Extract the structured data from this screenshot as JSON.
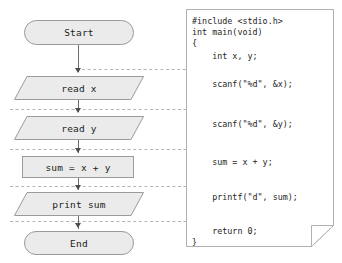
{
  "diagram": {
    "colors": {
      "shape_fill": "#ebebeb",
      "shape_border": "#9a9a9a",
      "connector": "#6d6d6d",
      "dashed_line": "#b4b4b4",
      "panel_border": "#b0b0b0",
      "panel_fill": "#ffffff",
      "text": "#1c1c1c",
      "background": "#ffffff"
    }
  },
  "flowchart": {
    "nodes": [
      {
        "id": "start",
        "label": "Start",
        "shape": "terminator"
      },
      {
        "id": "read_x",
        "label": "read x",
        "shape": "parallelogram"
      },
      {
        "id": "read_y",
        "label": "read y",
        "shape": "parallelogram"
      },
      {
        "id": "sum",
        "label": "sum = x + y",
        "shape": "rectangle"
      },
      {
        "id": "print_sum",
        "label": "print sum",
        "shape": "parallelogram"
      },
      {
        "id": "end",
        "label": "End",
        "shape": "terminator"
      }
    ],
    "edges": [
      {
        "from": "start",
        "to": "read_x",
        "style": "arrow"
      },
      {
        "from": "read_x",
        "to": "read_y",
        "style": "arrow"
      },
      {
        "from": "read_y",
        "to": "sum",
        "style": "arrow"
      },
      {
        "from": "sum",
        "to": "print_sum",
        "style": "arrow"
      },
      {
        "from": "print_sum",
        "to": "end",
        "style": "arrow"
      }
    ]
  },
  "code_panel": {
    "language": "C",
    "lines": [
      "#include <stdio.h>",
      "int main(void)",
      "{",
      "    int x, y;",
      "",
      "    scanf(\"%d\", &x);",
      "",
      "    scanf(\"%d\", &y);",
      "",
      "    sum = x + y;",
      "",
      "    printf(\"d\", sum);",
      "",
      "    return 0;",
      "}"
    ]
  },
  "mapping_lines": [
    {
      "from_node": "start",
      "to_code_line": "int x, y;"
    },
    {
      "from_node": "read_x",
      "to_code_line": "scanf(\"%d\", &x);"
    },
    {
      "from_node": "read_y",
      "to_code_line": "scanf(\"%d\", &y);"
    },
    {
      "from_node": "sum",
      "to_code_line": "sum = x + y;"
    },
    {
      "from_node": "print_sum",
      "to_code_line": "printf(\"d\", sum);"
    }
  ]
}
